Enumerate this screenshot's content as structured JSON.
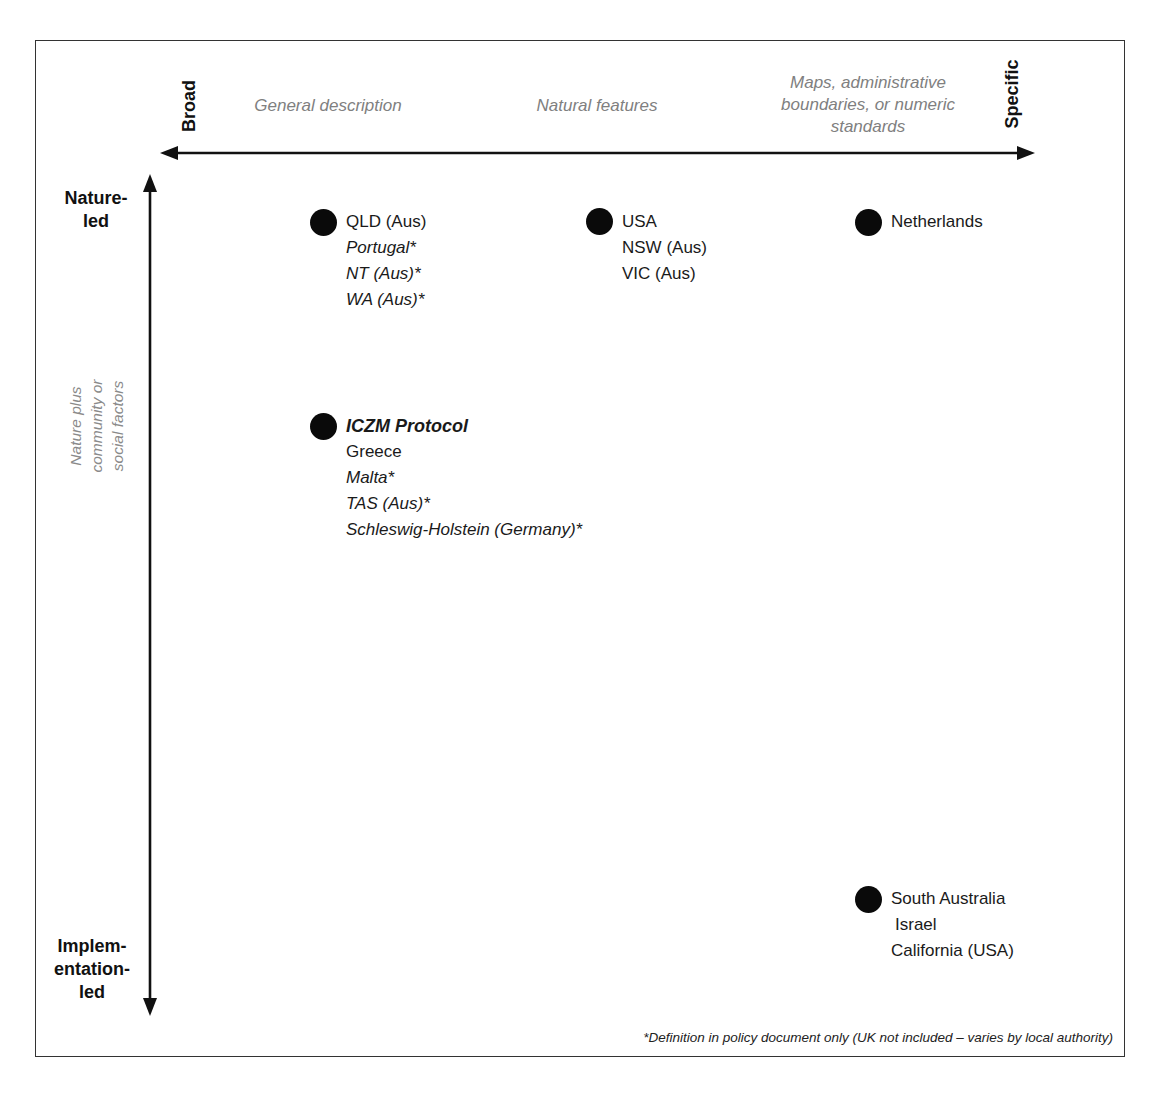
{
  "figure": {
    "x_axis": {
      "left_end": "Broad",
      "right_end": "Specific",
      "categories": [
        "General description",
        "Natural features",
        "Maps, administrative boundaries, or numeric standards"
      ],
      "category_lines": {
        "maps": [
          "Maps, administrative",
          "boundaries, or numeric",
          "standards"
        ]
      }
    },
    "y_axis": {
      "top_end": [
        "Nature-",
        "led"
      ],
      "bottom_end": [
        "Implem-",
        "entation-",
        "led"
      ],
      "middle": [
        "Nature plus",
        "community or",
        "social factors"
      ]
    },
    "groups": [
      {
        "id": "broad-nature",
        "items": [
          {
            "label": "QLD (Aus)",
            "style": "normal"
          },
          {
            "label": "Portugal*",
            "style": "italic"
          },
          {
            "label": "NT (Aus)*",
            "style": "italic"
          },
          {
            "label": "WA (Aus)*",
            "style": "italic"
          }
        ]
      },
      {
        "id": "natural-features-nature",
        "items": [
          {
            "label": "USA",
            "style": "normal"
          },
          {
            "label": "NSW (Aus)",
            "style": "normal"
          },
          {
            "label": "VIC (Aus)",
            "style": "normal"
          }
        ]
      },
      {
        "id": "specific-nature",
        "items": [
          {
            "label": "Netherlands",
            "style": "normal"
          }
        ]
      },
      {
        "id": "broad-community",
        "items": [
          {
            "label": "ICZM Protocol",
            "style": "bold-italic"
          },
          {
            "label": "Greece",
            "style": "normal"
          },
          {
            "label": "Malta*",
            "style": "italic"
          },
          {
            "label": "TAS (Aus)*",
            "style": "italic"
          },
          {
            "label": "Schleswig-Holstein (Germany)*",
            "style": "italic"
          }
        ]
      },
      {
        "id": "specific-implementation",
        "items": [
          {
            "label": "South Australia",
            "style": "normal"
          },
          {
            "label": "Israel",
            "style": "normal"
          },
          {
            "label": "California (USA)",
            "style": "normal"
          }
        ]
      }
    ],
    "footnote": "*Definition in policy document only (UK not included – varies by local authority)"
  }
}
